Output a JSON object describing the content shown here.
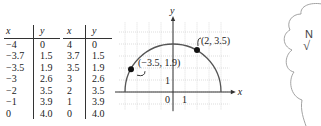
{
  "table": {
    "headers": [
      "x",
      "y",
      "x",
      "y"
    ],
    "rows": [
      [
        "−4",
        "0",
        "4",
        "0"
      ],
      [
        "−3.7",
        "1.5",
        "3.7",
        "1.5"
      ],
      [
        "−3.5",
        "1.9",
        "3.5",
        "1.9"
      ],
      [
        "−3",
        "2.6",
        "3",
        "2.6"
      ],
      [
        "−2",
        "3.5",
        "2",
        "3.5"
      ],
      [
        "−1",
        "3.9",
        "1",
        "3.9"
      ],
      [
        "0",
        "4.0",
        "0",
        "4.0"
      ]
    ]
  },
  "chart_data": {
    "type": "line",
    "title": "",
    "xlabel": "x",
    "ylabel": "y",
    "function": "y = sqrt(16 - x^2)",
    "x": [
      -4,
      -3.7,
      -3.5,
      -3,
      -2,
      -1,
      0,
      1,
      2,
      3,
      3.5,
      3.7,
      4
    ],
    "y": [
      0,
      1.5,
      1.9,
      2.6,
      3.5,
      3.9,
      4.0,
      3.9,
      3.5,
      2.6,
      1.9,
      1.5,
      0
    ],
    "xlim": [
      -4.5,
      5
    ],
    "ylim": [
      -1.5,
      6
    ],
    "grid": true,
    "tick_labels": {
      "origin": "0",
      "x_unit": "1",
      "y_unit": "1"
    },
    "highlighted_points": [
      {
        "x": -3.5,
        "y": 1.9,
        "label": "(−3.5, 1.9)"
      },
      {
        "x": 2,
        "y": 3.5,
        "label": "(2, 3.5)"
      }
    ]
  },
  "cloud": {
    "line1": "N",
    "line2": "√"
  }
}
